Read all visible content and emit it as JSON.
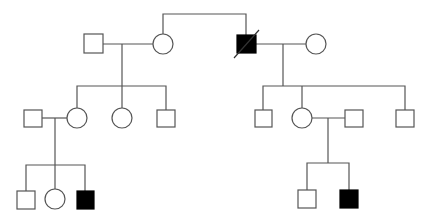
{
  "diagram": {
    "type": "pedigree",
    "colors": {
      "line": "#555555",
      "affected": "#000000",
      "unaffected": "#ffffff"
    },
    "individuals": [
      {
        "id": "I-1",
        "generation": 1,
        "sex": "male",
        "affected": false,
        "deceased": false
      },
      {
        "id": "I-2",
        "generation": 1,
        "sex": "female",
        "affected": false,
        "deceased": false
      },
      {
        "id": "I-3",
        "generation": 1,
        "sex": "male",
        "affected": true,
        "deceased": true
      },
      {
        "id": "I-4",
        "generation": 1,
        "sex": "female",
        "affected": false,
        "deceased": false
      },
      {
        "id": "II-1",
        "generation": 2,
        "sex": "male",
        "affected": false,
        "deceased": false
      },
      {
        "id": "II-2",
        "generation": 2,
        "sex": "female",
        "affected": false,
        "deceased": false
      },
      {
        "id": "II-3",
        "generation": 2,
        "sex": "female",
        "affected": false,
        "deceased": false
      },
      {
        "id": "II-4",
        "generation": 2,
        "sex": "male",
        "affected": false,
        "deceased": false
      },
      {
        "id": "II-5",
        "generation": 2,
        "sex": "male",
        "affected": false,
        "deceased": false
      },
      {
        "id": "II-6",
        "generation": 2,
        "sex": "female",
        "affected": false,
        "deceased": false
      },
      {
        "id": "II-7",
        "generation": 2,
        "sex": "male",
        "affected": false,
        "deceased": false
      },
      {
        "id": "II-8",
        "generation": 2,
        "sex": "male",
        "affected": false,
        "deceased": false
      },
      {
        "id": "III-1",
        "generation": 3,
        "sex": "male",
        "affected": false,
        "deceased": false
      },
      {
        "id": "III-2",
        "generation": 3,
        "sex": "female",
        "affected": false,
        "deceased": false
      },
      {
        "id": "III-3",
        "generation": 3,
        "sex": "male",
        "affected": true,
        "deceased": false
      },
      {
        "id": "III-4",
        "generation": 3,
        "sex": "male",
        "affected": false,
        "deceased": false
      },
      {
        "id": "III-5",
        "generation": 3,
        "sex": "male",
        "affected": true,
        "deceased": false
      }
    ],
    "relationships": [
      {
        "type": "sibling",
        "members": [
          "I-2",
          "I-3"
        ]
      },
      {
        "type": "mating",
        "members": [
          "I-1",
          "I-2"
        ],
        "children": [
          "II-2",
          "II-3",
          "II-4"
        ]
      },
      {
        "type": "mating",
        "members": [
          "I-3",
          "I-4"
        ],
        "children": [
          "II-5",
          "II-6",
          "II-8"
        ]
      },
      {
        "type": "mating",
        "members": [
          "II-1",
          "II-2"
        ],
        "children": [
          "III-1",
          "III-2",
          "III-3"
        ]
      },
      {
        "type": "mating",
        "members": [
          "II-6",
          "II-7"
        ],
        "children": [
          "III-4",
          "III-5"
        ]
      }
    ]
  }
}
